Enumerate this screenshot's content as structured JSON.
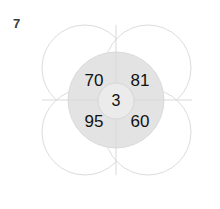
{
  "figure": {
    "label": "7",
    "type": "four-petal-number-puzzle",
    "colors": {
      "background": "#ffffff",
      "petal_fill": "#ffffff",
      "petal_stroke": "#dcdcdc",
      "inner_disc_fill": "#e3e3e3",
      "center_disc_fill": "#ebebeb",
      "divider_stroke": "#d9d9d9",
      "number_color": "#111111",
      "label_color": "#3a3a3a"
    },
    "center": {
      "value": "3"
    },
    "quadrants": [
      {
        "position": "top-left",
        "value": "70"
      },
      {
        "position": "top-right",
        "value": "81"
      },
      {
        "position": "bottom-left",
        "value": "95"
      },
      {
        "position": "bottom-right",
        "value": "60"
      }
    ],
    "petals": [
      {
        "position": "top-left",
        "value": ""
      },
      {
        "position": "top-right",
        "value": ""
      },
      {
        "position": "bottom-left",
        "value": ""
      },
      {
        "position": "bottom-right",
        "value": ""
      }
    ]
  }
}
